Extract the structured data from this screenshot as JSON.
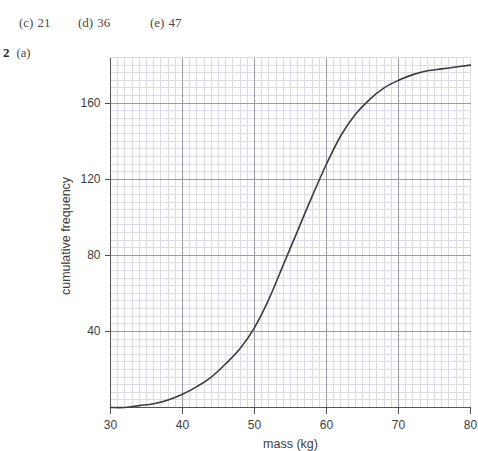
{
  "answers": {
    "options": [
      {
        "tag": "(c)",
        "value": "21"
      },
      {
        "tag": "(d)",
        "value": "36"
      },
      {
        "tag": "(e)",
        "value": "47"
      }
    ]
  },
  "question": {
    "number": "2",
    "part": "(a)"
  },
  "colors": {
    "curve": "#3c3c3c",
    "axis": "#555555",
    "major_grid": "#9a9aa8",
    "minor_grid": "#dcdce6",
    "text": "#3d3d3d",
    "background": "#ffffff"
  },
  "chart_data": {
    "type": "line",
    "title": "",
    "subtitle": "",
    "xlabel": "mass (kg)",
    "ylabel": "cumulative frequency",
    "xlim": [
      30,
      80
    ],
    "ylim": [
      0,
      184
    ],
    "xticks": [
      30,
      40,
      50,
      60,
      70,
      80
    ],
    "xtick_labels": [
      "30",
      "40",
      "50",
      "60",
      "70",
      "80"
    ],
    "yticks": [
      40,
      80,
      120,
      160
    ],
    "ytick_labels": [
      "40",
      "80",
      "120",
      "160"
    ],
    "grid": "major and minor",
    "minor_grid_divisions": 10,
    "legend": "none",
    "annotations": [],
    "series": [
      {
        "name": "cumulative frequency",
        "x": [
          30,
          32,
          34,
          36,
          38,
          40,
          42,
          44,
          46,
          48,
          50,
          52,
          54,
          56,
          58,
          60,
          62,
          64,
          66,
          68,
          70,
          72,
          74,
          76,
          78,
          80
        ],
        "values": [
          0,
          0,
          1,
          2,
          4,
          7,
          11,
          16,
          23,
          31,
          42,
          57,
          75,
          93,
          111,
          128,
          143,
          154,
          162,
          168,
          172,
          175,
          177,
          178,
          179,
          180
        ]
      }
    ]
  }
}
